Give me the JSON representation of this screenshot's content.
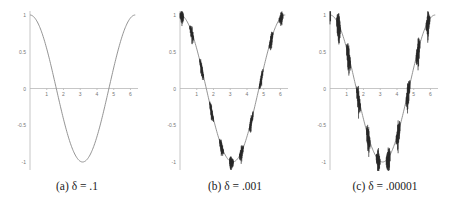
{
  "chart_data": [
    {
      "type": "line",
      "title": "",
      "caption": "(a) δ = .1",
      "function": "cos(x) perturbed with noise scale delta",
      "delta": 0.1,
      "noise_level": 0,
      "xlabel": "",
      "ylabel": "",
      "xlim": [
        0,
        6.3
      ],
      "ylim": [
        -1,
        1
      ],
      "x_ticks": [
        "1",
        "2",
        "3",
        "4",
        "5",
        "6"
      ],
      "y_ticks": [
        "1",
        "0.5",
        "0",
        "-0.5",
        "-1"
      ],
      "series": [
        {
          "name": "f",
          "x": [
            0,
            0.5,
            1,
            1.5,
            2,
            2.5,
            3,
            3.14,
            3.5,
            4,
            4.5,
            5,
            5.5,
            6,
            6.28
          ],
          "values": [
            1,
            0.88,
            0.54,
            0.07,
            -0.42,
            -0.8,
            -0.99,
            -1,
            -0.94,
            -0.65,
            -0.21,
            0.28,
            0.71,
            0.96,
            1
          ]
        }
      ]
    },
    {
      "type": "line",
      "title": "",
      "caption": "(b) δ = .001",
      "delta": 0.001,
      "noise_level": 0.12,
      "xlabel": "",
      "ylabel": "",
      "xlim": [
        0,
        6.3
      ],
      "ylim": [
        -1,
        1
      ],
      "x_ticks": [
        "1",
        "2",
        "3",
        "4",
        "5",
        "6"
      ],
      "y_ticks": [
        "1",
        "0.5",
        "0",
        "-0.5",
        "-1"
      ],
      "series": [
        {
          "name": "f",
          "x": [
            0,
            0.5,
            1,
            1.5,
            2,
            2.5,
            3,
            3.14,
            3.5,
            4,
            4.5,
            5,
            5.5,
            6,
            6.28
          ],
          "values": [
            1,
            0.88,
            0.54,
            0.07,
            -0.42,
            -0.8,
            -0.99,
            -1,
            -0.94,
            -0.65,
            -0.21,
            0.28,
            0.71,
            0.96,
            1
          ]
        }
      ]
    },
    {
      "type": "line",
      "title": "",
      "caption": "(c) δ = .00001",
      "delta": 1e-05,
      "noise_level": 0.22,
      "xlabel": "",
      "ylabel": "",
      "xlim": [
        0,
        6.3
      ],
      "ylim": [
        -1,
        1
      ],
      "x_ticks": [
        "1",
        "2",
        "3",
        "4",
        "5",
        "6"
      ],
      "y_ticks": [
        "1",
        "0.5",
        "0",
        "-0.5",
        "-1"
      ],
      "series": [
        {
          "name": "f",
          "x": [
            0,
            0.5,
            1,
            1.5,
            2,
            2.5,
            3,
            3.14,
            3.5,
            4,
            4.5,
            5,
            5.5,
            6,
            6.28
          ],
          "values": [
            1,
            0.88,
            0.54,
            0.07,
            -0.42,
            -0.8,
            -0.99,
            -1,
            -0.94,
            -0.65,
            -0.21,
            0.28,
            0.71,
            0.96,
            1
          ]
        }
      ]
    }
  ]
}
